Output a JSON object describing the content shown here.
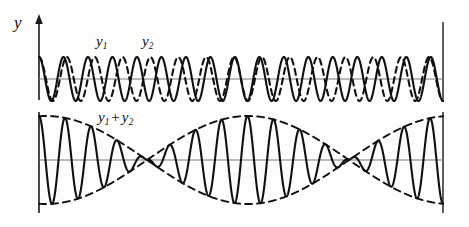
{
  "figure": {
    "background_color": "#fdfdfb",
    "curve_color": "#101010",
    "axis_color": "#6b6b6b"
  },
  "labels": {
    "y_axis": "y",
    "wave1": "y",
    "wave1_sub": "1",
    "wave2": "y",
    "wave2_sub": "2",
    "sum_first": "y",
    "sum_first_sub": "1",
    "sum_plus": "+",
    "sum_second": "y",
    "sum_second_sub": "2"
  },
  "chart_data": {
    "type": "line",
    "xlabel": "",
    "ylabel": "y",
    "grid": false,
    "legend": "inline-annotations",
    "panels": [
      {
        "name": "component-waves",
        "baseline_y": 79,
        "x_range_px": [
          39,
          443
        ],
        "amplitude_px": 22,
        "series": [
          {
            "name": "y1",
            "style": "solid",
            "cycles_across_axis": 16.5,
            "amplitude": 1,
            "phase": 0,
            "label": "y1"
          },
          {
            "name": "y2",
            "style": "dashed",
            "cycles_across_axis": 14.5,
            "amplitude": 1,
            "phase": 0,
            "label": "y2"
          }
        ]
      },
      {
        "name": "resultant-wave",
        "baseline_y": 160,
        "x_range_px": [
          39,
          443
        ],
        "amplitude_px": 44,
        "series": [
          {
            "name": "y1+y2",
            "style": "solid",
            "description": "sum of the two component waves, showing beats",
            "carrier_cycles": 15.5,
            "beat_nodes_px": [
              147,
              345
            ],
            "label": "y1 + y2"
          },
          {
            "name": "envelope-upper",
            "style": "dashed",
            "description": "positive beat envelope",
            "beat_cycles": 2
          },
          {
            "name": "envelope-lower",
            "style": "dashed",
            "description": "negative beat envelope",
            "beat_cycles": 2
          }
        ]
      }
    ],
    "axes": {
      "vertical_axis_x_px": 39,
      "vertical_axis_top_px": 18,
      "vertical_axis_bottom_px": 212,
      "right_border_x_px": 443,
      "arrow_head": "up"
    }
  }
}
